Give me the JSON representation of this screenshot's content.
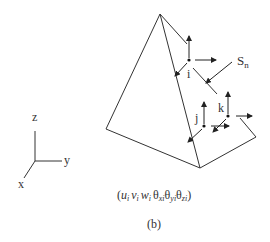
{
  "figure": {
    "caption": "(b)",
    "dof_label": {
      "open": "(",
      "u": "u",
      "u_sub": "i",
      "v": "v",
      "v_sub": "i",
      "w": "w",
      "w_sub": "i",
      "t1": "θ",
      "t1_sub": "xi",
      "t2": "θ",
      "t2_sub": "yi",
      "t3": "θ",
      "t3_sub": "zi",
      "close": ")"
    }
  },
  "axes": {
    "z_label": "z",
    "y_label": "y",
    "x_label": "x"
  },
  "nodes": {
    "i": "i",
    "j": "j",
    "k": "k"
  },
  "surface_label": {
    "main": "S",
    "sub": "n"
  },
  "colors": {
    "line": "#333333",
    "background": "#ffffff"
  }
}
